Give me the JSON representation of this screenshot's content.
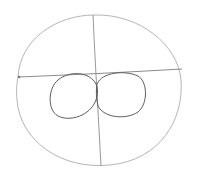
{
  "drawing": {
    "subject": "pencil sketch of a face construction: outer head circle with crossing guidelines and two eye ovals",
    "colors": {
      "background": "#ffffff",
      "outline_light": "#b8b8b8",
      "guide_line": "#8a8a8a",
      "eye_stroke": "#5a5a5a"
    },
    "shapes": {
      "head_circle": {
        "cx": 99,
        "cy": 95,
        "rx": 82,
        "ry": 82
      },
      "vertical_guide": {
        "x1": 93,
        "y1": 15,
        "x2": 101,
        "y2": 166
      },
      "horizontal_guide": {
        "x1": 18,
        "y1": 77,
        "x2": 182,
        "y2": 69
      },
      "left_eye": {
        "cx": 73,
        "cy": 96,
        "rx": 24,
        "ry": 23
      },
      "right_eye": {
        "cx": 121,
        "cy": 95,
        "rx": 24,
        "ry": 22
      }
    }
  }
}
